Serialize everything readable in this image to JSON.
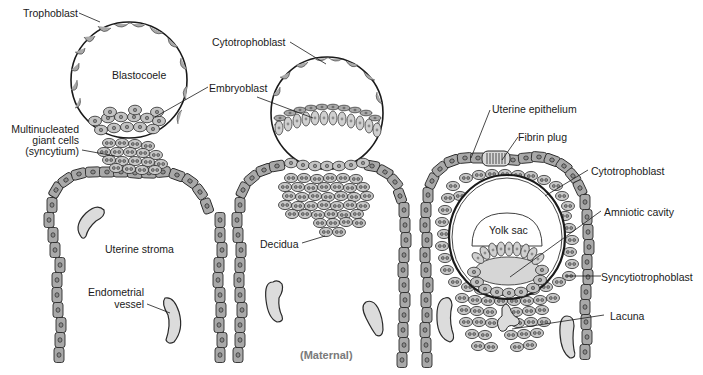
{
  "diagram": {
    "colors": {
      "cell_fill": "#a9a9a9",
      "cell_stroke": "#2a2a2a",
      "nucleus_fill": "#8c8c8c",
      "light_fill": "#d6d6d6",
      "vessel_fill": "#dcdcdc",
      "line": "#1a1a1a",
      "maternal_text": "#7a7a7a"
    },
    "panels": [
      {
        "id": "stage-1",
        "labels": {
          "trophoblast": "Trophoblast",
          "blastocoele": "Blastocoele",
          "embryoblast": "Embryoblast",
          "syncytium_line1": "Multinucleated",
          "syncytium_line2": "giant cells",
          "syncytium_line3": "(syncytium)",
          "uterine_stroma": "Uterine stroma",
          "vessel_line1": "Endometrial",
          "vessel_line2": "vessel"
        }
      },
      {
        "id": "stage-2",
        "labels": {
          "cytotrophoblast": "Cytotrophoblast",
          "decidua": "Decidua",
          "maternal": "(Maternal)"
        }
      },
      {
        "id": "stage-3",
        "labels": {
          "uterine_epithelium": "Uterine epithelium",
          "fibrin_plug": "Fibrin plug",
          "cytotrophoblast": "Cytotrophoblast",
          "amniotic_cavity": "Amniotic cavity",
          "yolk_sac": "Yolk sac",
          "syncytiotrophoblast": "Syncytiotrophoblast",
          "lacuna": "Lacuna"
        }
      }
    ]
  }
}
